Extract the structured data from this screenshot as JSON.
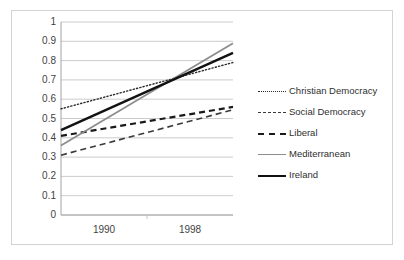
{
  "chart_data": {
    "type": "line",
    "title": "",
    "xlabel": "",
    "ylabel": "",
    "categories": [
      "1990",
      "1998"
    ],
    "x": [
      1990,
      1998
    ],
    "ylim": [
      0,
      1
    ],
    "ytick_step": 0.1,
    "ytick_labels": [
      "1",
      "0.9",
      "0.8",
      "0.7",
      "0.6",
      "0.5",
      "0.4",
      "0.3",
      "0.2",
      "0.1",
      "0"
    ],
    "ytick_values": [
      1,
      0.9,
      0.8,
      0.7,
      0.6,
      0.5,
      0.4,
      0.3,
      0.2,
      0.1,
      0
    ],
    "grid": "horizontal",
    "legend_position": "right",
    "series": [
      {
        "name": "Christian Democracy",
        "values": [
          0.55,
          0.79
        ],
        "style": "dotted",
        "color": "#2b2b2b",
        "width": 1.4
      },
      {
        "name": "Social Democracy",
        "values": [
          0.31,
          0.545
        ],
        "style": "dashed-thin",
        "color": "#3a3a3a",
        "width": 1.6
      },
      {
        "name": "Liberal",
        "values": [
          0.41,
          0.56
        ],
        "style": "dashed-thick",
        "color": "#1a1a1a",
        "width": 2.2
      },
      {
        "name": "Mediterranean",
        "values": [
          0.36,
          0.89
        ],
        "style": "solid-gray",
        "color": "#8d8d8d",
        "width": 1.8
      },
      {
        "name": "Ireland",
        "values": [
          0.44,
          0.84
        ],
        "style": "solid-black",
        "color": "#121212",
        "width": 2.4
      }
    ]
  },
  "axes": {
    "y_labels": [
      "1",
      "0.9",
      "0.8",
      "0.7",
      "0.6",
      "0.5",
      "0.4",
      "0.3",
      "0.2",
      "0.1",
      "0"
    ],
    "x_labels": [
      "1990",
      "1998"
    ]
  },
  "legend": {
    "items": [
      {
        "label": "Christian Democracy",
        "swatch": "dotted-line-icon"
      },
      {
        "label": "Social Democracy",
        "swatch": "dashed-line-icon"
      },
      {
        "label": "Liberal",
        "swatch": "dashed-bold-line-icon"
      },
      {
        "label": "Mediterranean",
        "swatch": "solid-gray-line-icon"
      },
      {
        "label": "Ireland",
        "swatch": "solid-black-line-icon"
      }
    ]
  },
  "colors": {
    "frame": "#d3d3d3",
    "grid": "#bfbfbf",
    "axis": "#9a9a9a",
    "text": "#3f3f3f",
    "background": "#ffffff"
  }
}
